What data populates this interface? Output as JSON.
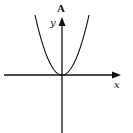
{
  "diagram": {
    "type": "function-graph",
    "function": "y = x^2 (parabola opening upward, vertex at origin)",
    "labels": {
      "figure_label": "A",
      "x_axis": "x",
      "y_axis": "y"
    },
    "colors": {
      "stroke": "#111111",
      "background": "#ffffff"
    }
  }
}
